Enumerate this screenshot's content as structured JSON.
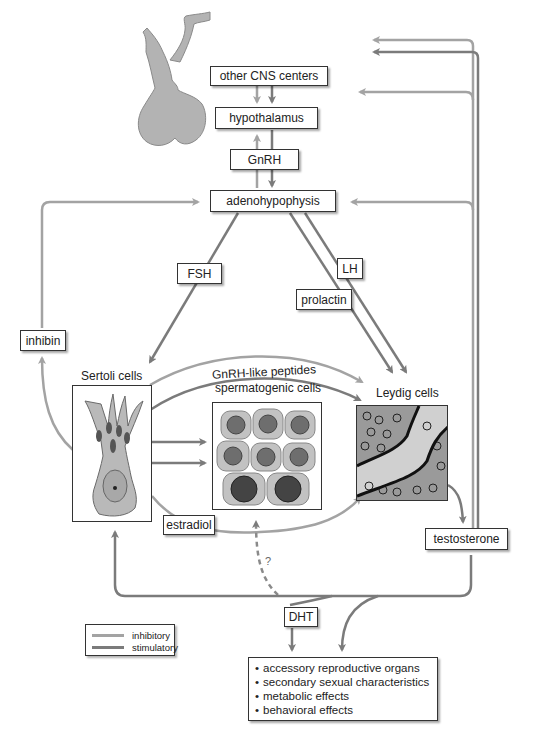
{
  "colors": {
    "inhibitory": "#a3a3a3",
    "stimulatory": "#7b7b7b",
    "pituitary_fill": "#b3b3b3",
    "box_border": "#333333"
  },
  "nodes": {
    "other_cns": "other CNS centers",
    "hypothalamus": "hypothalamus",
    "gnrh": "GnRH",
    "adenohypophysis": "adenohypophysis",
    "fsh": "FSH",
    "lh": "LH",
    "prolactin": "prolactin",
    "inhibin": "inhibin",
    "sertoli_cells": "Sertoli cells",
    "spermatogenic_cells": "spermatogenic cells",
    "leydig_cells": "Leydig cells",
    "gnrh_like_peptides": "GnRH-like peptides",
    "estradiol": "estradiol",
    "testosterone": "testosterone",
    "dht": "DHT",
    "unknown_mark": "?"
  },
  "effects": [
    "accessory reproductive organs",
    "secondary sexual characteristics",
    "metabolic effects",
    "behavioral effects"
  ],
  "legend": {
    "items": [
      {
        "label": "inhibitory",
        "color": "#a3a3a3"
      },
      {
        "label": "stimulatory",
        "color": "#7b7b7b"
      }
    ]
  }
}
